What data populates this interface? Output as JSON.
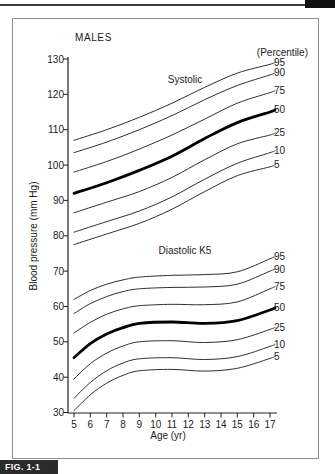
{
  "page": {
    "fig_label": "FIG. 1-1"
  },
  "figure": {
    "title": "MALES",
    "percentile_header": "(Percentile)",
    "y_axis": {
      "label": "Blood pressure (mm Hg)"
    },
    "x_axis": {
      "label": "Age (yr)"
    }
  },
  "chart_data": {
    "type": "line",
    "title": "MALES",
    "legend_title": "(Percentile)",
    "xlabel": "Age (yr)",
    "ylabel": "Blood pressure (mm Hg)",
    "xlim": [
      5,
      17
    ],
    "ylim": [
      30,
      130
    ],
    "x_ticks": [
      5,
      6,
      7,
      8,
      9,
      10,
      11,
      12,
      13,
      14,
      15,
      16,
      17
    ],
    "y_ticks": [
      130,
      120,
      110,
      100,
      90,
      80,
      70,
      60,
      50,
      40,
      30
    ],
    "grid": false,
    "legend_position": "right-of-curves",
    "line_color": "#2f2f2f",
    "emphasis_color": "#000000",
    "groups": [
      {
        "name": "Systolic",
        "x": [
          5,
          7,
          9,
          11,
          13,
          15,
          17
        ],
        "series": [
          {
            "name": "95",
            "values": [
              107,
              110,
              113.5,
              117.5,
              122,
              126,
              128.5
            ]
          },
          {
            "name": "90",
            "values": [
              103.5,
              106.5,
              110,
              114,
              118.5,
              122.5,
              125.5
            ]
          },
          {
            "name": "75",
            "values": [
              98,
              101,
              104.5,
              108.5,
              113,
              117.5,
              120.5
            ]
          },
          {
            "name": "50",
            "emphasis": true,
            "values": [
              92,
              95,
              98.5,
              102.5,
              107.5,
              112,
              115
            ]
          },
          {
            "name": "25",
            "values": [
              86.5,
              89.5,
              92.5,
              96.5,
              101.5,
              106,
              108.5
            ]
          },
          {
            "name": "10",
            "values": [
              81,
              84,
              87,
              91,
              96,
              100.5,
              103.5
            ]
          },
          {
            "name": "5",
            "values": [
              77.5,
              80.5,
              83.5,
              87.5,
              92.5,
              97,
              99.5
            ]
          }
        ]
      },
      {
        "name": "Diastolic K5",
        "x": [
          5,
          6,
          7,
          8,
          9,
          11,
          13,
          15,
          17
        ],
        "series": [
          {
            "name": "95",
            "values": [
              62,
              64.5,
              66.3,
              67.5,
              68.3,
              68.8,
              69,
              69.8,
              73.5
            ]
          },
          {
            "name": "90",
            "values": [
              58,
              60.8,
              62.8,
              64.2,
              65,
              65.4,
              65.5,
              66.3,
              70
            ]
          },
          {
            "name": "75",
            "values": [
              52.5,
              55.5,
              57.8,
              59.3,
              60.2,
              60.6,
              60.5,
              61.3,
              65
            ]
          },
          {
            "name": "50",
            "emphasis": true,
            "values": [
              45.5,
              49.5,
              52.2,
              54,
              55.2,
              55.6,
              55.2,
              56,
              59
            ]
          },
          {
            "name": "25",
            "values": [
              39.5,
              43.8,
              46.8,
              48.8,
              50,
              50.3,
              49.8,
              50.6,
              53.5
            ]
          },
          {
            "name": "10",
            "values": [
              34,
              38.5,
              41.8,
              44,
              45.2,
              45.5,
              45,
              45.8,
              48.7
            ]
          },
          {
            "name": "5",
            "values": [
              30.5,
              35,
              38.3,
              40.5,
              41.8,
              42.2,
              41.7,
              42.5,
              45.3
            ]
          }
        ]
      }
    ]
  }
}
